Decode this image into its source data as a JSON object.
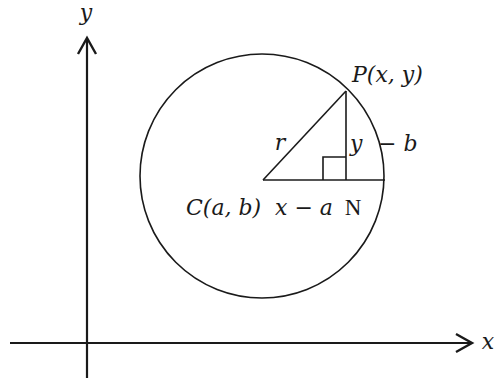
{
  "figure": {
    "type": "geometry-diagram",
    "colors": {
      "stroke": "#1a1a1a",
      "background": "#ffffff"
    }
  },
  "axes": {
    "x_label": "x",
    "y_label": "y"
  },
  "points": {
    "center_label": "C(a, b)",
    "point_label": "P(x, y)",
    "foot_label": "N"
  },
  "segments": {
    "radius_label": "r",
    "horizontal_label": "x − a",
    "vertical_label_left": "y",
    "vertical_label_right": "− b"
  },
  "geometry": {
    "y_axis": {
      "x": 87,
      "y_top": 38,
      "y_bottom": 378
    },
    "x_axis": {
      "y": 343,
      "x_left": 10,
      "x_right": 473
    },
    "circle": {
      "cx": 262,
      "cy": 176,
      "r": 122
    },
    "C": {
      "x": 263,
      "y": 180
    },
    "P": {
      "x": 346,
      "y": 91
    },
    "N": {
      "x": 346,
      "y": 180
    },
    "chord_end": {
      "x": 385,
      "y": 180
    },
    "right_angle_size": 23
  }
}
